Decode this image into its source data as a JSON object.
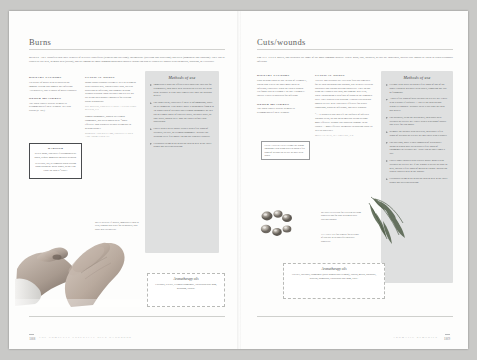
{
  "book": {
    "footer_left": "THE COMPLETE ESSENTIAL OILS HANDBOOK",
    "footer_right": "AROMATIC REMEDIES",
    "folio_left": "188",
    "folio_right": "189"
  },
  "left_page": {
    "title": "Burns",
    "intro_lead": "BURNS ARE",
    "intro": "classified into three degrees of severity: superficial (redness and swelling); intermediate (swelling and blistering); and deep (numbness and charring). They can be caused by dry heat, or moist heat (scalds), and are among the most common household injuries. Burns can also be caused by contact with chemicals, radiation, or electricity.",
    "columns": [
      {
        "sections": [
          {
            "heading": "DIETARY FACTORS",
            "body": "Eat plenty of garlic to help build up the immune system and combat any infection. Alternatively, take a course of garlic capsules."
          },
          {
            "heading": "OTHER MEASURES",
            "body": "The Bach Flower Rescue Remedy is recommended if there is shock. See also Scalds (p. 191).",
            "cite": ""
          }
        ]
      },
      {
        "sections": [
          {
            "heading": "CLINICAL NOTES",
            "body": "Minor burns respond extremely well to treatment with essential oils, which reduce pain, prevent blistering or infection, and promote healing without scarring. Both lavender and tea tree oil are being increasingly employed for treating burns in hospitals.",
            "cite": "DEL BEGGIO, ESSENTIAL OILS: A LITERATURE REVIEW, P. 9"
          },
          {
            "heading": "",
            "body": "Roman chamomile, known in German chamomile, has been shown to be “More effective than synthetic steroid treatments in healing burns.”",
            "cite": "ROBERTS AND WILLIAMS, ESSENTIAL OILS AND AROMATHERAPY"
          }
        ]
      }
    ],
    "methods": {
      "title": "Methods of use",
      "items": [
        "Immediately hold the affected area under the cold tap for ten minutes, then apply neat lavender or tea tree oil to the burn. Reapply at least three times a day until the skin has healed.",
        "For larger areas, especially if there is inflammation, apply an ice compress. First gently apply a lotion made from 4 to 10 drops each of lavender and German chamomile oil in a tub or a small bottle of distilled water, lavender water, or rose water, shaken well. Blot the tender before each application.",
        "Cover with a sterile gauze treated with a few drops of lavender, tea tree, or German chamomile. Replace the dressing every few hours. Do not use adhesive plasters.",
        "Calendula cream or oil helps the skin to heal in the latter stages and prevents scarring."
      ]
    },
    "warning": {
      "title": "WARNING",
      "body1": "Severe burns, especially if accompanied by shock, require immediate medical attention.",
      "body2": "Never boil, stir, or compress when treating burns during the initial stages, as they can cause the skin to “cook.”"
    },
    "aroma": {
      "title": "Aromatherapy oils",
      "body": "Lavender, tea tree, German chamomile, eucalyptus blue gum, geranium, yarrow."
    },
    "photo_caption": "MILD BURNS: If injured, immediately soak in clear, running cold water for ten minutes, then apply neat lavender oil."
  },
  "right_page": {
    "title": "Cuts/wounds",
    "intro_lead": "SMALL CUTS",
    "intro": "grazes, and scratches are some of the most common injuries. Where glass, rust, splinters, or dirt are concerned, special care should be taken to avoid secondary infection.",
    "columns": [
      {
        "sections": [
          {
            "heading": "DIETARY FACTORS",
            "body": "Slow healing could be due to lack of Vitamin C, which also leaves the body more open to infection, especially when the skin is broken. Eat foods rich in Vitamin C or take Vitamin C tablets. Garlic is indicated for infection."
          },
          {
            "heading": "OTHER MEASURES",
            "body": "The Bach Flower Rescue Remedy is recommended if there is shock."
          }
        ]
      },
      {
        "sections": [
          {
            "heading": "CLINICAL NOTES",
            "body": "Tea tree and lavender are excellent first-aid remedies for all skin abrasions and wounds, due to their excellent antiseptic and wound-healing properties. They do not sting the exposed raw skin, nor damage new cells, while encouraging a rich flow of blood to the damaged area. They also prevent scarring. Clinical research has shown tea tree to be especially effective for septic conditions, purulent infections, and dirty wounds.",
            "cite": ""
          },
          {
            "heading": "",
            "body": "“… it dissolved pus and left the surfaces of infected wounds clean, so that no germicidal action became more effective without any apparent damage to the tissues … most effective germicide destroying tissue as well as bacteria.”",
            "cite": "MCCLANAHAN, TEA TREE OIL, P. 8"
          }
        ]
      }
    ],
    "methods": {
      "title": "Methods of use",
      "items": [
        "Cleanse with water to which a few drops of any of the above essential oils have been added, removing any dirt or fragments.",
        "Apply a few drops of neat lavender or tea tree oil. Cover with a plaster if required — but let the skin breathe whenever possible. Reapply twice a day until the skin has healed.",
        "For splinters, clean the area gently, then apply neat lavender or tea tree oil. Cover with a waterproof plaster and leave for two hours.",
        "Remove the splinter with tweezers, then apply a few drops of lavender or tea tree oil and cover with a plaster.",
        "For swelling, apply a cold compress of witch hazel lotion to which have been added a few drops of chamomile or lavender oil. Apply two or three times a day.",
        "Cover larger injuries with a sterile gauze soaked with lavender or tea tree oil. If the wound is weepy or slow to heal, include a few drops of myrrh or yarrow. Myrrh can also be applied neat to the wound.",
        "Calendula cream or oil helps the skin to heal in the latter stages and prevents scarring."
      ]
    },
    "caption_box": "CUTS AND GRAZES: Cleanse the wound thoroughly with warm water to which a few drops of lavender or tea tree oil have been added.",
    "caption_myrrh": "MYRRH is excellent for excellent bleeding properties and for slow-healing or dirty cuts and wounds.",
    "caption_teatree": "TEA TREE is a fine remedy for all kinds of cuts due to its powerful antiseptic properties.",
    "aroma": {
      "title": "Aromatherapy oils",
      "body": "Tea tree, lavender, chamomile (both Roman and German), yarrow, myrrh, patchouli, benzoin, palmarosa, eucalyptus blue gum, clove."
    }
  },
  "colors": {
    "panel_gray": "#dfe0e0",
    "page_white": "#fdfdfc",
    "ink": "#5d5f62",
    "backdrop": "#c9c9c7"
  }
}
